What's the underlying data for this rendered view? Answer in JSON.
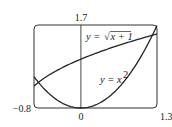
{
  "chart_data": {
    "type": "line",
    "title": "",
    "xlabel": "",
    "ylabel": "",
    "xlim": [
      -0.8,
      1.3
    ],
    "ylim": [
      0,
      1.7
    ],
    "grid": false,
    "tick_labels": {
      "x_left": "−0.8",
      "x_right": "1.3",
      "x_origin": "0",
      "y_top": "1.7"
    },
    "series": [
      {
        "name": "y = √(x + 1)",
        "x": [
          -0.8,
          -0.6,
          -0.4,
          -0.2,
          0,
          0.2,
          0.4,
          0.6,
          0.8,
          1.0,
          1.2,
          1.3
        ],
        "values": [
          0.447,
          0.632,
          0.775,
          0.894,
          1.0,
          1.095,
          1.183,
          1.265,
          1.342,
          1.414,
          1.483,
          1.517
        ]
      },
      {
        "name": "y = x²",
        "x": [
          -0.8,
          -0.6,
          -0.4,
          -0.2,
          0,
          0.2,
          0.4,
          0.6,
          0.8,
          1.0,
          1.2,
          1.3
        ],
        "values": [
          0.64,
          0.36,
          0.16,
          0.04,
          0,
          0.04,
          0.16,
          0.36,
          0.64,
          1.0,
          1.44,
          1.69
        ]
      }
    ],
    "annotations": [
      {
        "text_prefix": "y = ",
        "text_main": "x + 1",
        "label": "y = √(x + 1)"
      },
      {
        "text_prefix": "y = ",
        "text_main": "x",
        "superscript": "2",
        "label": "y = x²"
      }
    ]
  }
}
